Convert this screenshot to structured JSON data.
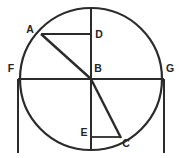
{
  "figure": {
    "type": "geometry-diagram",
    "background_color": "#ffffff",
    "stroke_color": "#2b2b2b",
    "label_color": "#252525",
    "circle": {
      "center": {
        "x": 91,
        "y": 79
      },
      "radius": 71,
      "stroke_width": 2.2
    },
    "points": [
      {
        "name": "A",
        "label": "A",
        "x": 41,
        "y": 34,
        "label_x": 30,
        "label_y": 33,
        "anchor": "middle"
      },
      {
        "name": "B",
        "label": "B",
        "x": 91,
        "y": 79,
        "label_x": 98,
        "label_y": 72,
        "anchor": "middle"
      },
      {
        "name": "C",
        "label": "C",
        "x": 120,
        "y": 137,
        "label_x": 126,
        "label_y": 147,
        "anchor": "middle"
      },
      {
        "name": "D",
        "label": "D",
        "x": 91,
        "y": 34,
        "label_x": 99,
        "label_y": 38,
        "anchor": "middle"
      },
      {
        "name": "E",
        "label": "E",
        "x": 91,
        "y": 137,
        "label_x": 84,
        "label_y": 136,
        "anchor": "middle"
      },
      {
        "name": "F",
        "label": "F",
        "x": 20,
        "y": 79,
        "label_x": 11,
        "label_y": 72,
        "anchor": "middle"
      },
      {
        "name": "G",
        "label": "G",
        "x": 162,
        "y": 79,
        "label_x": 170,
        "label_y": 72,
        "anchor": "middle"
      }
    ],
    "segments": [
      {
        "name": "segment-FG-diameter",
        "x1": 18,
        "y1": 79,
        "x2": 164,
        "y2": 79,
        "width": 2.0
      },
      {
        "name": "segment-BD-vertical-radius",
        "x1": 91,
        "y1": 8,
        "x2": 91,
        "y2": 150,
        "width": 2.0
      },
      {
        "name": "segment-BA-radius",
        "x1": 91,
        "y1": 79,
        "x2": 41,
        "y2": 34,
        "width": 2.4
      },
      {
        "name": "segment-BC-radius",
        "x1": 91,
        "y1": 79,
        "x2": 121,
        "y2": 138,
        "width": 2.4
      },
      {
        "name": "segment-AD",
        "x1": 41,
        "y1": 34,
        "x2": 92,
        "y2": 34,
        "width": 1.8
      },
      {
        "name": "segment-EC",
        "x1": 91,
        "y1": 137,
        "x2": 121,
        "y2": 137,
        "width": 1.8
      },
      {
        "name": "segment-F-vertical-drop",
        "x1": 18,
        "y1": 79,
        "x2": 18,
        "y2": 153,
        "width": 2.0
      },
      {
        "name": "segment-G-vertical-drop",
        "x1": 164,
        "y1": 79,
        "x2": 164,
        "y2": 153,
        "width": 2.0
      }
    ]
  }
}
